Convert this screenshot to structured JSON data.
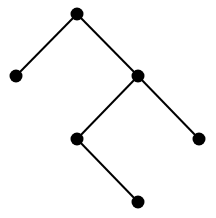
{
  "diagram": {
    "type": "binary-tree",
    "node_color": "#000000",
    "edge_color": "#000000",
    "node_radius": 6.5,
    "nodes": [
      {
        "id": "root",
        "x": 77,
        "y": 14
      },
      {
        "id": "left",
        "x": 16,
        "y": 76
      },
      {
        "id": "right",
        "x": 138,
        "y": 76
      },
      {
        "id": "right-left",
        "x": 77,
        "y": 139
      },
      {
        "id": "right-right",
        "x": 199,
        "y": 139
      },
      {
        "id": "right-left-right",
        "x": 138,
        "y": 202
      }
    ],
    "edges": [
      {
        "from": "root",
        "to": "left"
      },
      {
        "from": "root",
        "to": "right"
      },
      {
        "from": "right",
        "to": "right-left"
      },
      {
        "from": "right",
        "to": "right-right"
      },
      {
        "from": "right-left",
        "to": "right-left-right"
      }
    ]
  }
}
